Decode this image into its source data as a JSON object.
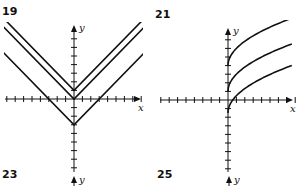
{
  "problem_labels": [
    "19",
    "21",
    "23",
    "25"
  ],
  "chart_data": [
    {
      "id": "19",
      "type": "line",
      "title": "19",
      "xlabel": "x",
      "ylabel": "y",
      "xlim": [
        -8,
        8
      ],
      "ylim": [
        -8,
        8
      ],
      "grid": false,
      "series": [
        {
          "name": "y = |x| + 1",
          "shift": 1,
          "x": [
            -8,
            0,
            8
          ],
          "y": [
            9,
            1,
            9
          ]
        },
        {
          "name": "y = |x|",
          "shift": 0,
          "x": [
            -8,
            0,
            8
          ],
          "y": [
            8,
            0,
            8
          ]
        },
        {
          "name": "y = |x| - 3",
          "shift": -3,
          "x": [
            -8,
            0,
            8
          ],
          "y": [
            5,
            -3,
            5
          ]
        }
      ]
    },
    {
      "id": "21",
      "type": "line",
      "title": "21",
      "xlabel": "x",
      "ylabel": "y",
      "xlim": [
        -8,
        8
      ],
      "ylim": [
        -8,
        8
      ],
      "grid": false,
      "series": [
        {
          "name": "y = 2√x + 4",
          "shift": 4,
          "x": [
            0,
            1,
            2,
            4,
            6,
            7.5
          ],
          "y": [
            4,
            6,
            6.83,
            8,
            8.9,
            9.48
          ]
        },
        {
          "name": "y = 2√x + 1",
          "shift": 1,
          "x": [
            0,
            1,
            2,
            4,
            6,
            7.5
          ],
          "y": [
            1,
            3,
            3.83,
            5,
            5.9,
            6.48
          ]
        },
        {
          "name": "y = 2√x - 1.5",
          "shift": -1.5,
          "x": [
            0,
            1,
            2,
            4,
            6,
            7.5
          ],
          "y": [
            -1.5,
            0.5,
            1.33,
            2.5,
            3.4,
            3.98
          ]
        }
      ]
    },
    {
      "id": "23",
      "type": "line",
      "title": "23",
      "ylabel": "y",
      "series": []
    },
    {
      "id": "25",
      "type": "line",
      "title": "25",
      "ylabel": "y",
      "series": []
    }
  ]
}
